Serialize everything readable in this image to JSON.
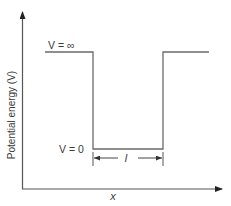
{
  "diagram": {
    "type": "infinite-square-well",
    "y_axis_label": "Potential energy (V)",
    "x_axis_label": "x",
    "top_label": "V = ∞",
    "bottom_label": "V = 0",
    "width_label": "l",
    "line_color": "#6a6a6a",
    "text_color": "#3a3a3a"
  }
}
